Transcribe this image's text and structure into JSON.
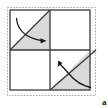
{
  "figure": {
    "label": "a",
    "colors": {
      "shade": "#d9d9d9",
      "stroke": "#3a3a3a",
      "dotted_frame": "#9a9a9a",
      "background": "#ffffff",
      "arrow": "#1a1a1a",
      "label": "#111111"
    },
    "frame": {
      "type": "dotted-rectangle",
      "x": 7,
      "y": 7,
      "width": 89,
      "height": 89
    },
    "square": {
      "x": 10,
      "y": 10,
      "width": 80,
      "height": 80,
      "rows": 2,
      "cols": 2,
      "cell_size": 40
    },
    "quadrants": [
      {
        "name": "top-left",
        "fill": "white-with-shaded-lower-right-triangle",
        "diagonal": "bottom-left-to-top-right",
        "shaded_triangle": "lower-right"
      },
      {
        "name": "top-right",
        "fill": "white",
        "diagonal": "none",
        "shaded_triangle": "none"
      },
      {
        "name": "bottom-left",
        "fill": "white",
        "diagonal": "none",
        "shaded_triangle": "none"
      },
      {
        "name": "bottom-right",
        "fill": "white-with-shaded-upper-left-triangle",
        "diagonal": "bottom-left-to-top-right",
        "shaded_triangle": "upper-left"
      }
    ],
    "arrows": [
      {
        "name": "fold-arrow-top",
        "direction": "rightward",
        "from": [
          17,
          19
        ],
        "to": [
          46,
          41
        ],
        "description": "curved arrow sweeping from upper-left down and to the right into the shaded top-left triangle"
      },
      {
        "name": "fold-arrow-bottom",
        "direction": "upward-left",
        "from": [
          90,
          88
        ],
        "to": [
          59,
          62
        ],
        "description": "curved arrow sweeping from lower-right up and to the left into the shaded bottom-right triangle"
      }
    ]
  }
}
